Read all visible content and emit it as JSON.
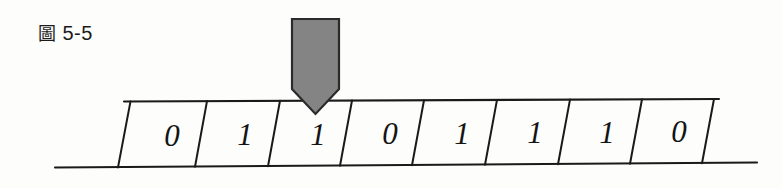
{
  "figure": {
    "caption_cjk": "圖",
    "caption_number": "5-5",
    "caption_full": "圖 5-5"
  },
  "tape": {
    "cells": [
      {
        "index": 1,
        "value": "0"
      },
      {
        "index": 2,
        "value": "1"
      },
      {
        "index": 3,
        "value": "1"
      },
      {
        "index": 4,
        "value": "0"
      },
      {
        "index": 5,
        "value": "1"
      },
      {
        "index": 6,
        "value": "1"
      },
      {
        "index": 7,
        "value": "1"
      },
      {
        "index": 8,
        "value": "0"
      }
    ],
    "sequence": "01101110",
    "cell_count": 8
  },
  "head": {
    "name": "read-write-head",
    "points_at_cell_index": 3,
    "points_at_value": "1",
    "fill_color": "#848484",
    "stroke_color": "#2b2b2b"
  },
  "colors": {
    "background": "#fdfdfc",
    "ink": "#1a1a1a",
    "head_gray": "#848484"
  }
}
